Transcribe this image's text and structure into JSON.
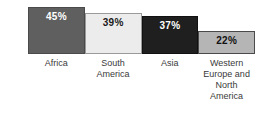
{
  "chart_data": {
    "type": "bar",
    "title": "",
    "xlabel": "",
    "ylabel": "",
    "ylim": [
      0,
      50
    ],
    "grid": false,
    "legend": false,
    "categories": [
      "Africa",
      "South America",
      "Asia",
      "Western Europe and North America"
    ],
    "values": [
      45,
      39,
      37,
      22
    ],
    "bars": [
      {
        "category": "Africa",
        "value": 45,
        "value_label": "45%",
        "fill_color": "#5f5f5f",
        "border_color": "#4a4a4a",
        "label_text_color": "#ffffff"
      },
      {
        "category": "South America",
        "value": 39,
        "value_label": "39%",
        "fill_color": "#ececec",
        "border_color": "#9a9a9a",
        "label_text_color": "#1a1a1a"
      },
      {
        "category": "Asia",
        "value": 37,
        "value_label": "37%",
        "fill_color": "#1f1f1f",
        "border_color": "#111111",
        "label_text_color": "#ffffff"
      },
      {
        "category": "Western Europe and North America",
        "value": 22,
        "value_label": "22%",
        "fill_color": "#b5b5b5",
        "border_color": "#4a4a4a",
        "label_text_color": "#111111"
      }
    ]
  }
}
